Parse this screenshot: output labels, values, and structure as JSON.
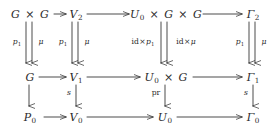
{
  "diagram": {
    "type": "commutative-diagram",
    "rows": 3,
    "columns": 4,
    "ink_color": "#2b2b2b",
    "background_color": "#ffffff",
    "nodes": {
      "r0c0": "G × G",
      "r0c1": "V₂",
      "r0c2": "U₀ × G × G",
      "r0c3": "Γ₂",
      "r1c0": "G",
      "r1c1": "V₁",
      "r1c2": "U₀ × G",
      "r1c3": "Γ₁",
      "r2c0": "P₀",
      "r2c1": "V₀",
      "r2c2": "U₀",
      "r2c3": "Γ₀"
    },
    "vertical_labels": {
      "top_col0_left": "p₁",
      "top_col0_right": "μ",
      "top_col1_left": "p₁",
      "top_col1_right": "μ",
      "top_col2_left": "id×p₁",
      "top_col2_right": "id×μ",
      "top_col3_left": "p₁",
      "top_col3_right": "μ",
      "bottom_col0": "",
      "bottom_col1": "s",
      "bottom_col2": "pr",
      "bottom_col3": "s"
    },
    "arrow_kinds": {
      "horizontal": "single",
      "upper_vertical": "double-parallel",
      "lower_vertical": "single"
    }
  }
}
